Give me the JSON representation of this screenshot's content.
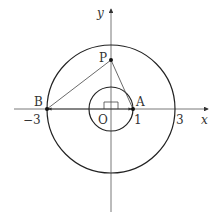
{
  "diagram": {
    "type": "coordinate-geometry",
    "axes": {
      "x_label": "x",
      "y_label": "y",
      "origin_label": "O"
    },
    "ticks": {
      "neg3": "−3",
      "one": "1",
      "three": "3"
    },
    "circles": [
      {
        "name": "outer",
        "center": "O",
        "radius": 3
      },
      {
        "name": "inner",
        "center": "O",
        "radius": 1
      }
    ],
    "points": {
      "P": {
        "label": "P",
        "coords": [
          0,
          1.5
        ]
      },
      "A": {
        "label": "A",
        "coords": [
          1,
          0
        ]
      },
      "B": {
        "label": "B",
        "coords": [
          -3,
          0
        ]
      }
    },
    "segments": [
      "PA",
      "PB"
    ],
    "vectors": [
      "OA",
      "OB"
    ],
    "markers": [
      "right-angle at O"
    ]
  }
}
